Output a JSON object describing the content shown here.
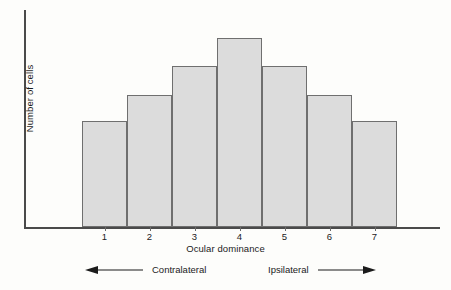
{
  "figure": {
    "background_color": "#fdfdfb",
    "axis_color": "#4a4a4a"
  },
  "chart_data": {
    "type": "bar",
    "title": "",
    "subtitle": "",
    "xlabel": "Ocular dominance",
    "ylabel": "Number of cells",
    "categories": [
      "1",
      "2",
      "3",
      "4",
      "5",
      "6",
      "7"
    ],
    "values": [
      49,
      61,
      74,
      87,
      74,
      61,
      49
    ],
    "ylim": [
      0,
      100
    ],
    "xlim": [
      0.5,
      7.5
    ],
    "grid": false,
    "legend": null,
    "bar_fill_color": "#dcdcdc",
    "bar_edge_color": "#6f6f6f",
    "annotations": [
      {
        "name": "contralateral",
        "label": "Contralateral",
        "arrow": "left"
      },
      {
        "name": "ipsilateral",
        "label": "Ipsilateral",
        "arrow": "right"
      }
    ]
  }
}
